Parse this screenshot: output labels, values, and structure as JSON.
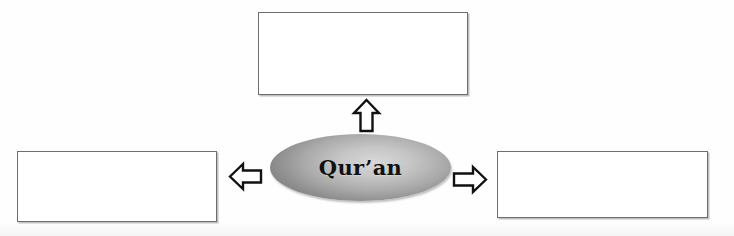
{
  "diagram": {
    "type": "concept-web",
    "center": {
      "label": "Qur’an",
      "shape": "ellipse",
      "fill": "#b5b5b5",
      "text_color": "#111111"
    },
    "boxes": [
      {
        "id": "top",
        "label": "",
        "position": "top",
        "fill": "#ffffff",
        "border_color": "#6e6e6e"
      },
      {
        "id": "left",
        "label": "",
        "position": "left",
        "fill": "#ffffff",
        "border_color": "#6e6e6e"
      },
      {
        "id": "right",
        "label": "",
        "position": "right",
        "fill": "#ffffff",
        "border_color": "#6e6e6e"
      }
    ],
    "arrows": [
      {
        "id": "up",
        "icon": "block-arrow-up-icon",
        "direction": "up",
        "from": "center",
        "to": "top"
      },
      {
        "id": "left",
        "icon": "block-arrow-left-icon",
        "direction": "left",
        "from": "center",
        "to": "left"
      },
      {
        "id": "right",
        "icon": "block-arrow-right-icon",
        "direction": "right",
        "from": "center",
        "to": "right"
      }
    ],
    "background_color": "#fefefe"
  }
}
